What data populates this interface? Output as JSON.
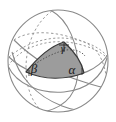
{
  "figure": {
    "name": "spherical-triangle-diagram",
    "background_color": "#ffffff",
    "outline_color": "#8a8a8a",
    "dashed_color": "#9a9a9a",
    "triangle_edge_color": "#3a3a3a",
    "triangle_fill_color": "#9c9c9c",
    "sphere": {
      "center_x": 58,
      "center_y": 61,
      "radius_x": 50,
      "radius_y": 51
    },
    "labels": [
      {
        "id": "gamma",
        "text": "γ",
        "x": 63,
        "y": 48,
        "size": 11
      },
      {
        "id": "beta",
        "text": "β",
        "x": 32,
        "y": 71,
        "size": 12
      },
      {
        "id": "alpha",
        "text": "α",
        "x": 73,
        "y": 72,
        "size": 12
      }
    ],
    "vertices": [
      {
        "id": "vertex-beta",
        "x": 26,
        "y": 72
      },
      {
        "id": "vertex-alpha",
        "x": 84,
        "y": 73
      },
      {
        "id": "vertex-gamma",
        "x": 64,
        "y": 42
      }
    ]
  }
}
